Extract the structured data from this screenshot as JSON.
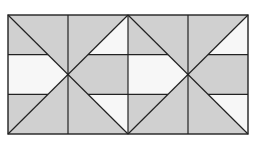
{
  "diagram": {
    "kind": "quilt-block-pattern",
    "colors": {
      "background": "#ffffff",
      "dark": "#d0d0d0",
      "light": "#f7f7f7",
      "line": "#222222"
    },
    "outer": {
      "x": 8,
      "y": 15,
      "width": 240,
      "height": 119
    },
    "blocks": [
      {
        "id": "block-1",
        "x": 8,
        "y": 15,
        "size": 120
      },
      {
        "id": "block-2",
        "x": 128,
        "y": 15,
        "size": 120
      }
    ],
    "band_fractions": [
      0.333,
      0.667
    ],
    "pattern": {
      "top_wedge": "dark",
      "bottom_wedge": "dark",
      "left_top": "dark",
      "left_middle": "light",
      "left_bottom": "dark",
      "right_top": "light",
      "right_middle": "dark",
      "right_bottom": "light"
    }
  }
}
